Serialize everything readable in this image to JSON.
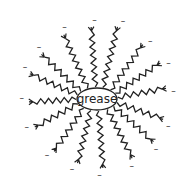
{
  "diagram": {
    "center_label": "grease",
    "charge_symbol": "–",
    "center": {
      "x": 97,
      "y": 99
    },
    "ellipse": {
      "rx": 20,
      "ry": 11
    },
    "stroke_color": "#222222",
    "tails": [
      {
        "x": 91,
        "y": 25
      },
      {
        "x": 118,
        "y": 25
      },
      {
        "x": 144,
        "y": 43
      },
      {
        "x": 162,
        "y": 62
      },
      {
        "x": 168,
        "y": 88
      },
      {
        "x": 165,
        "y": 120
      },
      {
        "x": 155,
        "y": 143
      },
      {
        "x": 133,
        "y": 160
      },
      {
        "x": 103,
        "y": 170
      },
      {
        "x": 77,
        "y": 165
      },
      {
        "x": 53,
        "y": 153
      },
      {
        "x": 33,
        "y": 128
      },
      {
        "x": 27,
        "y": 102
      },
      {
        "x": 28,
        "y": 73
      },
      {
        "x": 40,
        "y": 53
      },
      {
        "x": 63,
        "y": 33
      }
    ]
  }
}
